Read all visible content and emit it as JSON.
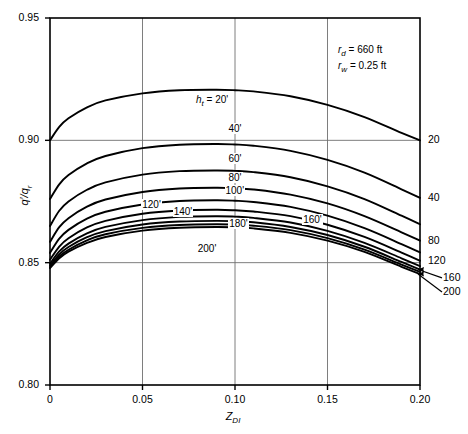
{
  "chart_data": {
    "type": "line",
    "title": "",
    "xlabel": "Z_DI",
    "xlabel_base": "Z",
    "xlabel_sub": "DI",
    "ylabel": "q'/q_r",
    "xlim": [
      0,
      0.2
    ],
    "ylim": [
      0.8,
      0.95
    ],
    "grid": true,
    "xticks": [
      "0",
      "0.05",
      "0.10",
      "0.15",
      "0.20"
    ],
    "xtick_values": [
      0,
      0.05,
      0.1,
      0.15,
      0.2
    ],
    "yticks": [
      "0.80",
      "0.85",
      "0.90",
      "0.95"
    ],
    "ytick_values": [
      0.8,
      0.85,
      0.9,
      0.95
    ],
    "legend_position": "inline-curve-labels",
    "annotations": [
      {
        "name": "rd",
        "base": "r",
        "sub": "d",
        "text": "= 660 ft"
      },
      {
        "name": "rw",
        "base": "r",
        "sub": "w",
        "text": "= 0.25 ft"
      }
    ],
    "series_title": {
      "base": "h",
      "sub": "t",
      "text": "= 20'"
    },
    "series": [
      {
        "name": "20'",
        "right_label": "20",
        "x": [
          0,
          0.005,
          0.01,
          0.02,
          0.03,
          0.05,
          0.07,
          0.09,
          0.1,
          0.11,
          0.13,
          0.15,
          0.17,
          0.19,
          0.2
        ],
        "values": [
          0.9,
          0.9055,
          0.909,
          0.9135,
          0.9163,
          0.9192,
          0.9205,
          0.9207,
          0.9205,
          0.92,
          0.918,
          0.9145,
          0.9095,
          0.903,
          0.9
        ]
      },
      {
        "name": "40'",
        "right_label": "40",
        "x": [
          0,
          0.005,
          0.01,
          0.02,
          0.03,
          0.05,
          0.07,
          0.09,
          0.1,
          0.11,
          0.13,
          0.15,
          0.17,
          0.19,
          0.2
        ],
        "values": [
          0.876,
          0.882,
          0.8858,
          0.8906,
          0.8936,
          0.8968,
          0.8982,
          0.8985,
          0.8983,
          0.8978,
          0.8957,
          0.892,
          0.8868,
          0.88,
          0.8765
        ]
      },
      {
        "name": "60'",
        "right_label": "",
        "x": [
          0,
          0.005,
          0.01,
          0.02,
          0.03,
          0.05,
          0.07,
          0.09,
          0.1,
          0.11,
          0.13,
          0.15,
          0.17,
          0.19,
          0.2
        ],
        "values": [
          0.865,
          0.8712,
          0.875,
          0.8798,
          0.8828,
          0.886,
          0.8874,
          0.8877,
          0.8875,
          0.887,
          0.8849,
          0.8812,
          0.876,
          0.8692,
          0.8657
        ]
      },
      {
        "name": "80'",
        "right_label": "80",
        "x": [
          0,
          0.005,
          0.01,
          0.02,
          0.03,
          0.05,
          0.07,
          0.09,
          0.1,
          0.11,
          0.13,
          0.15,
          0.17,
          0.19,
          0.2
        ],
        "values": [
          0.8585,
          0.8645,
          0.8682,
          0.8729,
          0.8758,
          0.8789,
          0.8803,
          0.8806,
          0.8804,
          0.8799,
          0.8778,
          0.8742,
          0.869,
          0.8624,
          0.859
        ]
      },
      {
        "name": "100'",
        "right_label": "",
        "x": [
          0,
          0.005,
          0.01,
          0.02,
          0.03,
          0.05,
          0.07,
          0.09,
          0.1,
          0.11,
          0.13,
          0.15,
          0.17,
          0.19,
          0.2
        ],
        "values": [
          0.854,
          0.8598,
          0.8634,
          0.868,
          0.8708,
          0.8738,
          0.8752,
          0.8755,
          0.8753,
          0.8748,
          0.8728,
          0.8692,
          0.8641,
          0.8576,
          0.8542
        ]
      },
      {
        "name": "120'",
        "right_label": "120",
        "x": [
          0,
          0.005,
          0.01,
          0.02,
          0.03,
          0.05,
          0.07,
          0.09,
          0.1,
          0.11,
          0.13,
          0.15,
          0.17,
          0.19,
          0.2
        ],
        "values": [
          0.8512,
          0.8566,
          0.86,
          0.8644,
          0.8671,
          0.87,
          0.8713,
          0.8716,
          0.8714,
          0.8709,
          0.869,
          0.8655,
          0.8605,
          0.8541,
          0.8508
        ]
      },
      {
        "name": "140'",
        "right_label": "",
        "x": [
          0,
          0.005,
          0.01,
          0.02,
          0.03,
          0.05,
          0.07,
          0.09,
          0.1,
          0.11,
          0.13,
          0.15,
          0.17,
          0.19,
          0.2
        ],
        "values": [
          0.8496,
          0.8546,
          0.8578,
          0.862,
          0.8646,
          0.8674,
          0.8687,
          0.869,
          0.8688,
          0.8683,
          0.8664,
          0.863,
          0.8581,
          0.8518,
          0.8486
        ]
      },
      {
        "name": "160'",
        "right_label": "160",
        "x": [
          0,
          0.005,
          0.01,
          0.02,
          0.03,
          0.05,
          0.07,
          0.09,
          0.1,
          0.11,
          0.13,
          0.15,
          0.17,
          0.19,
          0.2
        ],
        "values": [
          0.8488,
          0.8534,
          0.8564,
          0.8604,
          0.8629,
          0.8656,
          0.8668,
          0.8671,
          0.8669,
          0.8665,
          0.8646,
          0.8613,
          0.8565,
          0.8503,
          0.8472
        ]
      },
      {
        "name": "180'",
        "right_label": "",
        "x": [
          0,
          0.005,
          0.01,
          0.02,
          0.03,
          0.05,
          0.07,
          0.09,
          0.1,
          0.11,
          0.13,
          0.15,
          0.17,
          0.19,
          0.2
        ],
        "values": [
          0.8482,
          0.8525,
          0.8553,
          0.8591,
          0.8616,
          0.8642,
          0.8654,
          0.8657,
          0.8655,
          0.8651,
          0.8633,
          0.86,
          0.8553,
          0.8492,
          0.8462
        ]
      },
      {
        "name": "200'",
        "right_label": "200",
        "x": [
          0,
          0.005,
          0.01,
          0.02,
          0.03,
          0.05,
          0.07,
          0.09,
          0.1,
          0.11,
          0.13,
          0.15,
          0.17,
          0.19,
          0.2
        ],
        "values": [
          0.8478,
          0.8518,
          0.8545,
          0.8581,
          0.8605,
          0.8631,
          0.8643,
          0.8646,
          0.8644,
          0.864,
          0.8622,
          0.859,
          0.8544,
          0.8483,
          0.8454
        ]
      }
    ],
    "curve_labels": [
      {
        "text": "40'",
        "x": 0.1,
        "y": 0.901,
        "dy": -9
      },
      {
        "text": "60'",
        "x": 0.1,
        "y": 0.8885,
        "dy": -9
      },
      {
        "text": "80'",
        "x": 0.1,
        "y": 0.8808,
        "dy": -9
      },
      {
        "text": "100'",
        "x": 0.1,
        "y": 0.8757,
        "dy": -9
      },
      {
        "text": "120'",
        "x": 0.055,
        "y": 0.8706,
        "dy": -7
      },
      {
        "text": "140'",
        "x": 0.072,
        "y": 0.868,
        "dy": -7
      },
      {
        "text": "160'",
        "x": 0.142,
        "y": 0.8646,
        "dy": -7
      },
      {
        "text": "180'",
        "x": 0.102,
        "y": 0.8628,
        "dy": -7
      },
      {
        "text": "200'",
        "x": 0.085,
        "y": 0.86,
        "dy": 11
      }
    ],
    "right_leaders": [
      {
        "text": "160",
        "tip_x": 0.2,
        "tip_y": 0.8472
      },
      {
        "text": "200",
        "tip_x": 0.2,
        "tip_y": 0.8454
      }
    ],
    "colors": {
      "line": "#000000",
      "grid": "#6f6f6f",
      "frame": "#000000",
      "background": "#ffffff"
    }
  }
}
